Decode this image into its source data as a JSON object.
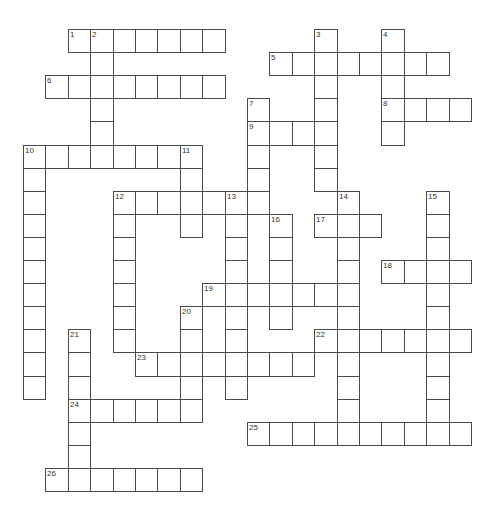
{
  "puzzle": {
    "type": "crossword",
    "grid": {
      "origin_x": 23,
      "origin_y": 29,
      "cell_width": 22.4,
      "cell_height": 23.1,
      "rows": 20,
      "cols": 20
    },
    "colors": {
      "border": "#4a4a4a",
      "cell_bg": "#ffffff",
      "number": "#333333"
    },
    "entries": [
      {
        "number": "1",
        "direction": "across",
        "row": 0,
        "col": 2,
        "length": 7
      },
      {
        "number": "2",
        "direction": "down",
        "row": 0,
        "col": 3,
        "length": 6
      },
      {
        "number": "3",
        "direction": "down",
        "row": 0,
        "col": 13,
        "length": 7
      },
      {
        "number": "4",
        "direction": "down",
        "row": 0,
        "col": 16,
        "length": 5
      },
      {
        "number": "5",
        "direction": "across",
        "row": 1,
        "col": 11,
        "length": 8
      },
      {
        "number": "6",
        "direction": "across",
        "row": 2,
        "col": 1,
        "length": 8
      },
      {
        "number": "7",
        "direction": "down",
        "row": 3,
        "col": 10,
        "length": 5
      },
      {
        "number": "8",
        "direction": "across",
        "row": 3,
        "col": 16,
        "length": 4
      },
      {
        "number": "9",
        "direction": "across",
        "row": 4,
        "col": 10,
        "length": 4
      },
      {
        "number": "10",
        "direction": "across",
        "row": 5,
        "col": 0,
        "length": 8
      },
      {
        "number": "10",
        "direction": "down",
        "row": 5,
        "col": 0,
        "length": 11
      },
      {
        "number": "11",
        "direction": "down",
        "row": 5,
        "col": 7,
        "length": 4
      },
      {
        "number": "12",
        "direction": "across",
        "row": 7,
        "col": 4,
        "length": 7
      },
      {
        "number": "12",
        "direction": "down",
        "row": 7,
        "col": 4,
        "length": 7
      },
      {
        "number": "13",
        "direction": "down",
        "row": 7,
        "col": 9,
        "length": 9
      },
      {
        "number": "14",
        "direction": "down",
        "row": 7,
        "col": 14,
        "length": 11
      },
      {
        "number": "15",
        "direction": "down",
        "row": 7,
        "col": 18,
        "length": 11
      },
      {
        "number": "16",
        "direction": "down",
        "row": 8,
        "col": 11,
        "length": 5
      },
      {
        "number": "17",
        "direction": "across",
        "row": 8,
        "col": 13,
        "length": 3
      },
      {
        "number": "18",
        "direction": "across",
        "row": 10,
        "col": 16,
        "length": 4
      },
      {
        "number": "19",
        "direction": "across",
        "row": 11,
        "col": 8,
        "length": 7
      },
      {
        "number": "20",
        "direction": "down",
        "row": 12,
        "col": 7,
        "length": 5
      },
      {
        "number": "21",
        "direction": "down",
        "row": 13,
        "col": 2,
        "length": 7
      },
      {
        "number": "22",
        "direction": "across",
        "row": 13,
        "col": 13,
        "length": 7
      },
      {
        "number": "23",
        "direction": "across",
        "row": 14,
        "col": 5,
        "length": 8
      },
      {
        "number": "24",
        "direction": "across",
        "row": 16,
        "col": 2,
        "length": 6
      },
      {
        "number": "25",
        "direction": "across",
        "row": 17,
        "col": 10,
        "length": 10
      },
      {
        "number": "26",
        "direction": "across",
        "row": 19,
        "col": 1,
        "length": 7
      }
    ]
  }
}
